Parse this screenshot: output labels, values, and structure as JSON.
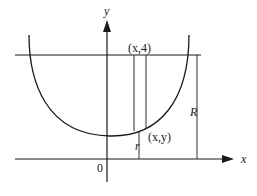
{
  "diagram": {
    "type": "coordinate-sketch",
    "axes": {
      "x_label": "x",
      "y_label": "y",
      "origin_label": "0"
    },
    "labels": {
      "top_point": "(x,4)",
      "curve_point": "(x,y)",
      "radius_small": "r",
      "radius_large": "R"
    },
    "elements": [
      "U-shaped curve symmetric about a vertical line",
      "horizontal line y = 4",
      "thin vertical strip between curve and line y = 4",
      "distance r from x-axis to curve point",
      "distance R from x-axis to line y = 4"
    ],
    "colors": {
      "stroke": "#1a1a1a",
      "background": "#ffffff"
    }
  }
}
